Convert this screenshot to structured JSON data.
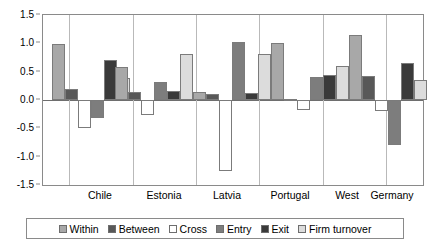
{
  "chart_data": {
    "type": "bar",
    "title": "",
    "subtitle": "",
    "xlabel": "",
    "ylabel": "",
    "ylim": [
      -1.5,
      1.5
    ],
    "ytick_labels": [
      "1.5",
      "1.0",
      "0.5",
      "0.0",
      "-0.5",
      "-1.0",
      "-1.5"
    ],
    "ytick_values": [
      1.5,
      1.0,
      0.5,
      0.0,
      -0.5,
      -1.0,
      -1.5
    ],
    "grid": false,
    "legend_position": "bottom",
    "categories": [
      "Chile",
      "Estonia",
      "Latvia",
      "Portugal",
      "West",
      "Germany"
    ],
    "series": [
      {
        "name": "Within",
        "color": "#a8a8a8",
        "values": [
          0.98,
          0.58,
          0.15,
          1.0,
          1.15,
          null
        ]
      },
      {
        "name": "Between",
        "color": "#585858",
        "values": [
          0.2,
          0.15,
          0.1,
          0.02,
          0.43,
          0.43
        ]
      },
      {
        "name": "Cross",
        "color": "#ffffff",
        "values": [
          -0.5,
          -0.26,
          -1.25,
          -0.17,
          -0.2,
          -0.2
        ]
      },
      {
        "name": "Entry",
        "color": "#7d7d7d",
        "values": [
          -0.32,
          0.31,
          1.03,
          0.4,
          -0.8,
          -0.8
        ]
      },
      {
        "name": "Exit",
        "color": "#3a3a3a",
        "values": [
          0.7,
          0.16,
          0.12,
          0.44,
          0.65,
          0.65
        ]
      },
      {
        "name": "Firm turnover",
        "color": "#dcdcdc",
        "values": [
          0.39,
          0.81,
          0.82,
          0.6,
          0.35,
          0.35
        ]
      }
    ]
  },
  "legend": {
    "items": [
      {
        "label": "Within",
        "color": "#a8a8a8"
      },
      {
        "label": "Between",
        "color": "#585858"
      },
      {
        "label": "Cross",
        "color": "#ffffff"
      },
      {
        "label": "Entry",
        "color": "#7d7d7d"
      },
      {
        "label": "Exit",
        "color": "#3a3a3a"
      },
      {
        "label": "Firm turnover",
        "color": "#dcdcdc"
      }
    ]
  },
  "axes": {
    "y_min": -1.5,
    "y_max": 1.5,
    "y_step": 0.5
  },
  "bars": [
    {
      "group": "Chile",
      "series": "Within",
      "value": 0.98,
      "x": 9,
      "w": 13,
      "color": "#a8a8a8"
    },
    {
      "group": "Chile",
      "series": "Between",
      "value": 0.2,
      "x": 22,
      "w": 13,
      "color": "#585858"
    },
    {
      "group": "Chile",
      "series": "Cross",
      "value": -0.5,
      "x": 35,
      "w": 13,
      "color": "#ffffff"
    },
    {
      "group": "Chile",
      "series": "Entry",
      "value": -0.32,
      "x": 48,
      "w": 13,
      "color": "#7d7d7d"
    },
    {
      "group": "Chile",
      "series": "Exit",
      "value": 0.7,
      "x": 61,
      "w": 13,
      "color": "#3a3a3a"
    },
    {
      "group": "Chile",
      "series": "Firm turnover",
      "value": 0.39,
      "x": 74,
      "w": 13,
      "color": "#dcdcdc"
    },
    {
      "group": "Estonia",
      "series": "Within",
      "value": 0.58,
      "x": 72,
      "w": 13,
      "color": "#a8a8a8"
    },
    {
      "group": "Estonia",
      "series": "Between",
      "value": 0.15,
      "x": 85,
      "w": 13,
      "color": "#585858"
    },
    {
      "group": "Estonia",
      "series": "Cross",
      "value": -0.26,
      "x": 98,
      "w": 13,
      "color": "#ffffff"
    },
    {
      "group": "Estonia",
      "series": "Entry",
      "value": 0.31,
      "x": 111,
      "w": 13,
      "color": "#7d7d7d"
    },
    {
      "group": "Estonia",
      "series": "Exit",
      "value": 0.16,
      "x": 124,
      "w": 13,
      "color": "#3a3a3a"
    },
    {
      "group": "Estonia",
      "series": "Firm turnover",
      "value": 0.81,
      "x": 137,
      "w": 13,
      "color": "#dcdcdc"
    },
    {
      "group": "Latvia",
      "series": "Within",
      "value": 0.15,
      "x": 150,
      "w": 13,
      "color": "#a8a8a8"
    },
    {
      "group": "Latvia",
      "series": "Between",
      "value": 0.1,
      "x": 163,
      "w": 13,
      "color": "#585858"
    },
    {
      "group": "Latvia",
      "series": "Cross",
      "value": -1.25,
      "x": 176,
      "w": 13,
      "color": "#ffffff"
    },
    {
      "group": "Latvia",
      "series": "Entry",
      "value": 1.03,
      "x": 189,
      "w": 13,
      "color": "#7d7d7d"
    },
    {
      "group": "Latvia",
      "series": "Exit",
      "value": 0.12,
      "x": 202,
      "w": 13,
      "color": "#3a3a3a"
    },
    {
      "group": "Latvia",
      "series": "Firm turnover",
      "value": 0.82,
      "x": 215,
      "w": 13,
      "color": "#dcdcdc"
    },
    {
      "group": "Portugal",
      "series": "Within",
      "value": 1.0,
      "x": 228,
      "w": 13,
      "color": "#a8a8a8"
    },
    {
      "group": "Portugal",
      "series": "Between",
      "value": 0.02,
      "x": 241,
      "w": 13,
      "color": "#585858"
    },
    {
      "group": "Portugal",
      "series": "Cross",
      "value": -0.17,
      "x": 254,
      "w": 13,
      "color": "#ffffff"
    },
    {
      "group": "Portugal",
      "series": "Entry",
      "value": 0.4,
      "x": 267,
      "w": 13,
      "color": "#7d7d7d"
    },
    {
      "group": "Portugal",
      "series": "Exit",
      "value": 0.44,
      "x": 280,
      "w": 13,
      "color": "#3a3a3a"
    },
    {
      "group": "Portugal",
      "series": "Firm turnover",
      "value": 0.6,
      "x": 293,
      "w": 13,
      "color": "#dcdcdc"
    },
    {
      "group": "West",
      "series": "Within",
      "value": 1.15,
      "x": 306,
      "w": 13,
      "color": "#a8a8a8"
    },
    {
      "group": "West",
      "series": "Between",
      "value": 0.43,
      "x": 319,
      "w": 13,
      "color": "#585858"
    },
    {
      "group": "West",
      "series": "Cross",
      "value": -0.2,
      "x": 332,
      "w": 13,
      "color": "#ffffff"
    },
    {
      "group": "West",
      "series": "Entry",
      "value": -0.8,
      "x": 345,
      "w": 13,
      "color": "#7d7d7d"
    },
    {
      "group": "West",
      "series": "Exit",
      "value": 0.65,
      "x": 358,
      "w": 13,
      "color": "#3a3a3a"
    },
    {
      "group": "West",
      "series": "Firm turnover",
      "value": 0.35,
      "x": 371,
      "w": 13,
      "color": "#dcdcdc"
    }
  ],
  "group_ticks": [
    {
      "label": "Chile",
      "x": 58
    },
    {
      "label": "Estonia",
      "x": 122
    },
    {
      "label": "Latvia",
      "x": 185
    },
    {
      "label": "Portugal",
      "x": 248
    },
    {
      "label": "West",
      "x": 305
    },
    {
      "label": "Germany",
      "x": 350
    }
  ],
  "group_separators": [
    26,
    90,
    153,
    216,
    280,
    343
  ]
}
